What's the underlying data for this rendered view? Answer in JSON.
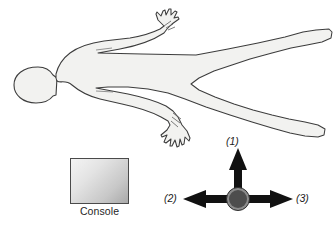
{
  "diagram": {
    "body_figure": {
      "name": "human-body-outline",
      "orientation": "supine, head at left, feet at right",
      "fill_color": "#f2f2f0",
      "stroke_color": "#3c3c3c"
    },
    "console": {
      "label": "Console",
      "fill_gradient_from": "#f4f4f4",
      "fill_gradient_to": "#a9a9a9",
      "border_color": "#4a4a4a"
    },
    "pivot": {
      "name": "pivot-point",
      "fill_color": "#4d4d4d",
      "ring_color": "#8c8c8c"
    },
    "arrows": [
      {
        "id": "1",
        "label": "(1)",
        "direction": "up",
        "color": "#111111"
      },
      {
        "id": "2",
        "label": "(2)",
        "direction": "left",
        "color": "#111111"
      },
      {
        "id": "3",
        "label": "(3)",
        "direction": "right",
        "color": "#111111"
      }
    ]
  }
}
